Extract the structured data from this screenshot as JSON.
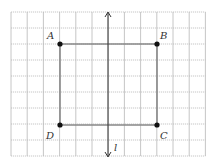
{
  "diagram": {
    "type": "grid-reflection",
    "grid": {
      "left": 11,
      "top": 12,
      "cell_w": 16.2,
      "cell_h": 16.0,
      "cols": 12,
      "rows": 9,
      "line_color": "#b8b8b8"
    },
    "rectangle": {
      "stroke": "#888888",
      "vertices": [
        {
          "label": "A",
          "x": 60,
          "y": 44,
          "lx": 47,
          "ly": 39
        },
        {
          "label": "B",
          "x": 157,
          "y": 44,
          "lx": 160,
          "ly": 39
        },
        {
          "label": "C",
          "x": 157,
          "y": 125,
          "lx": 160,
          "ly": 139
        },
        {
          "label": "D",
          "x": 60,
          "y": 125,
          "lx": 46,
          "ly": 139
        }
      ]
    },
    "axis": {
      "label": "l",
      "x": 108,
      "y1": 12,
      "y2": 157,
      "label_x": 114,
      "label_y": 151,
      "color": "#333333"
    }
  }
}
